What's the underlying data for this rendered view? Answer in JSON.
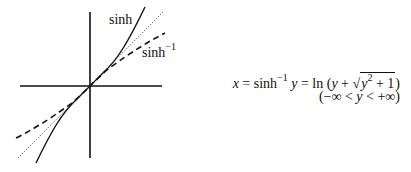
{
  "figure": {
    "type": "function-graph",
    "axes": {
      "horizontal": {
        "x1": 20,
        "y": 86,
        "x2": 162
      },
      "vertical": {
        "x": 90,
        "y1": 12,
        "y2": 158
      }
    },
    "curves": [
      {
        "name": "sinh",
        "style": "solid",
        "color": "#111111"
      },
      {
        "name": "identity",
        "style": "dotted",
        "color": "#111111"
      },
      {
        "name": "sinh^-1",
        "style": "dashed",
        "color": "#111111"
      }
    ],
    "labels": {
      "sinh": "sinh",
      "asinh_base": "sinh",
      "asinh_exp": "−1"
    }
  },
  "formula": {
    "line1": {
      "x": "x",
      "eq1": " = sinh",
      "exp": "−1",
      "y": " y",
      "eq2": " = ln (",
      "y2": "y",
      "plus": " + ",
      "rad_y": "y",
      "rad_exp": "2",
      "rad_rest": " + 1",
      "close": ")"
    },
    "line2": {
      "open": "(−∞ < ",
      "y": "y",
      "close": " < +∞)"
    }
  }
}
